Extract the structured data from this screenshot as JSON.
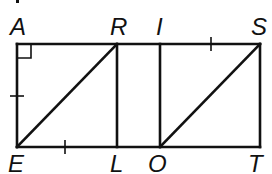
{
  "diagram": {
    "colors": {
      "stroke": "#111111",
      "background": "#ffffff"
    },
    "points": {
      "A": {
        "label": "A",
        "x": 17,
        "y": 44
      },
      "R": {
        "label": "R",
        "x": 117,
        "y": 44
      },
      "I": {
        "label": "I",
        "x": 160,
        "y": 44
      },
      "S": {
        "label": "S",
        "x": 260,
        "y": 44
      },
      "E": {
        "label": "E",
        "x": 17,
        "y": 147
      },
      "L": {
        "label": "L",
        "x": 117,
        "y": 147
      },
      "O": {
        "label": "O",
        "x": 160,
        "y": 147
      },
      "T": {
        "label": "T",
        "x": 260,
        "y": 147
      }
    },
    "segments": [
      "AS",
      "ET",
      "AE",
      "ST",
      "RL",
      "IO",
      "ER",
      "OS"
    ],
    "marks": {
      "right_angle": "A",
      "congruent_ticks": [
        "AE",
        "EL",
        "IS"
      ]
    }
  }
}
